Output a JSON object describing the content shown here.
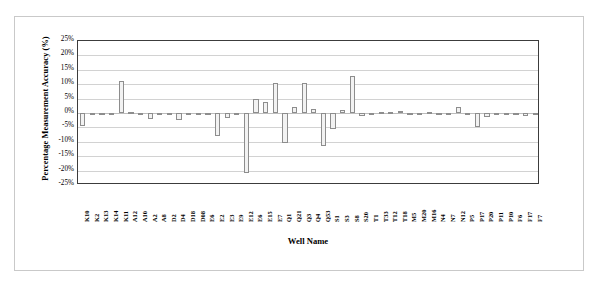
{
  "chart_data": {
    "type": "bar",
    "title": "",
    "xlabel": "Well Name",
    "ylabel": "Percentage Measurement Accuracy (%)",
    "ylim": [
      -25,
      25
    ],
    "ytick_step": 5,
    "grid": true,
    "legend": "none",
    "ytick_labels": [
      "25%",
      "20%",
      "15%",
      "10%",
      "5%",
      "0%",
      "-5%",
      "-10%",
      "-15%",
      "-20%",
      "-25%"
    ],
    "ytick_values": [
      25,
      20,
      15,
      10,
      5,
      0,
      -5,
      -10,
      -15,
      -20,
      -25
    ],
    "categories": [
      "K10",
      "K2",
      "K13",
      "K14",
      "K11",
      "A12",
      "A10",
      "A2",
      "A8",
      "D2",
      "D4",
      "D18",
      "D08",
      "E6",
      "E2",
      "E3",
      "E9",
      "E12",
      "E6",
      "E15",
      "E7",
      "Q1",
      "Q21",
      "Q3",
      "Q4",
      "Q53",
      "S1",
      "S3",
      "S8",
      "S20",
      "T1",
      "T33",
      "T12",
      "T18",
      "M5",
      "M20",
      "M16",
      "N4",
      "N7",
      "N12",
      "P5",
      "P17",
      "P20",
      "P11",
      "P10",
      "F6",
      "F17",
      "F7"
    ],
    "values": [
      -4.5,
      -0.3,
      -0.3,
      -0.4,
      11.0,
      0.4,
      -0.3,
      -2.0,
      -0.4,
      -0.3,
      -2.5,
      -0.3,
      -0.3,
      -0.8,
      -8.0,
      -1.8,
      -0.3,
      -21.0,
      5.0,
      3.8,
      10.5,
      -10.5,
      2.0,
      10.5,
      1.5,
      -11.5,
      -5.5,
      1.2,
      13.0,
      -1.0,
      -0.4,
      0.4,
      0.5,
      0.8,
      -0.2,
      -0.3,
      0.5,
      -0.3,
      -0.3,
      2.0,
      -0.4,
      -5.0,
      -1.5,
      -0.3,
      -0.3,
      -0.3,
      -1.0,
      -0.3
    ],
    "bar_fill": "#f2f2f2",
    "bar_edge": "#8d8d8d"
  }
}
